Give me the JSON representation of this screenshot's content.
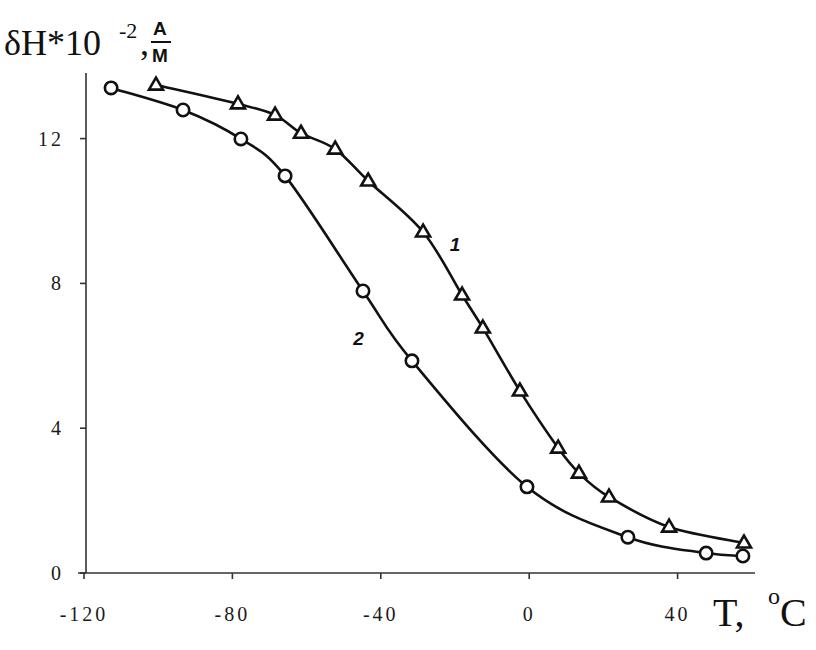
{
  "chart_data": {
    "type": "line",
    "title": "",
    "xlabel": "T, °C",
    "ylabel": "δH*10^-2, A/M",
    "xlim": [
      -120,
      60
    ],
    "ylim": [
      0,
      13.8
    ],
    "xticks": [
      -120,
      -80,
      -40,
      0,
      40
    ],
    "yticks": [
      0,
      4,
      8,
      12
    ],
    "grid": false,
    "legend": "inline curve labels",
    "series": [
      {
        "name": "1",
        "marker": "triangle",
        "x": [
          -100.6,
          -78.5,
          -68.5,
          -61.5,
          -52.3,
          -43.4,
          -28.6,
          -18.1,
          -12.5,
          -2.5,
          7.8,
          13.4,
          21.5,
          37.7,
          57.9
        ],
        "y": [
          13.48,
          12.96,
          12.65,
          12.15,
          11.71,
          10.83,
          9.42,
          7.68,
          6.77,
          5.03,
          3.45,
          2.76,
          2.1,
          1.27,
          0.83
        ],
        "label_pos": [
          -20,
          8.9
        ]
      },
      {
        "name": "2",
        "marker": "circle",
        "x": [
          -112.7,
          -93.3,
          -77.7,
          -65.8,
          -44.8,
          -31.6,
          -0.6,
          26.6,
          47.7,
          57.6
        ],
        "y": [
          13.4,
          12.79,
          11.99,
          10.97,
          7.79,
          5.86,
          2.38,
          0.99,
          0.55,
          0.47
        ],
        "label_pos": [
          -46,
          6.3
        ]
      }
    ]
  },
  "labels": {
    "y_main": "δH*10",
    "y_exp": "-2",
    "y_comma": ",",
    "y_unit_num": "A",
    "y_unit_den": "M",
    "x_main": "T, ",
    "x_deg": "o",
    "x_unit": "C"
  }
}
